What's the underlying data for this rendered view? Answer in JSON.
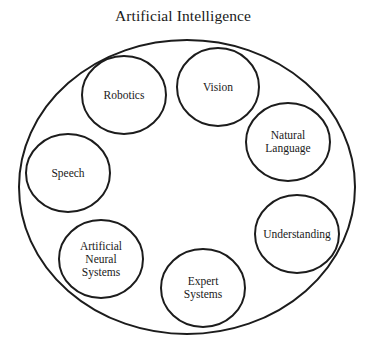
{
  "title": "Artificial Intelligence",
  "container": {
    "label": "Artificial Intelligence",
    "cx": 187,
    "cy": 187,
    "rx": 168,
    "ry": 147
  },
  "nodes": [
    {
      "id": "robotics",
      "lines": [
        "Robotics"
      ],
      "cx": 124,
      "cy": 95,
      "rx": 42,
      "ry": 39
    },
    {
      "id": "vision",
      "lines": [
        "Vision"
      ],
      "cx": 218,
      "cy": 87,
      "rx": 41,
      "ry": 39
    },
    {
      "id": "natural-language",
      "lines": [
        "Natural",
        "Language"
      ],
      "cx": 288,
      "cy": 142,
      "rx": 42,
      "ry": 39
    },
    {
      "id": "speech",
      "lines": [
        "Speech"
      ],
      "cx": 68,
      "cy": 173,
      "rx": 42,
      "ry": 39
    },
    {
      "id": "understanding",
      "lines": [
        "Understanding"
      ],
      "cx": 297,
      "cy": 234,
      "rx": 42,
      "ry": 39
    },
    {
      "id": "artificial-neural-systems",
      "lines": [
        "Artificial",
        "Neural",
        "Systems"
      ],
      "cx": 101,
      "cy": 259,
      "rx": 42,
      "ry": 39
    },
    {
      "id": "expert-systems",
      "lines": [
        "Expert",
        "Systems"
      ],
      "cx": 203,
      "cy": 288,
      "rx": 42,
      "ry": 39
    }
  ],
  "colors": {
    "stroke": "#1c1c1c",
    "text": "#1a1a1a",
    "background": "#ffffff"
  }
}
